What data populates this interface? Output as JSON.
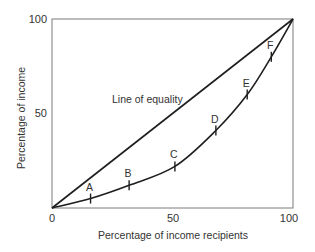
{
  "chart_data": {
    "type": "line",
    "title": "",
    "xlabel": "Percentage of income recipients",
    "ylabel": "Percentage of income",
    "xlim": [
      0,
      100
    ],
    "ylim": [
      0,
      100
    ],
    "x_ticks": [
      "0",
      "50",
      "100"
    ],
    "y_ticks": [
      "50",
      "100"
    ],
    "grid": false,
    "legend": null,
    "annotations": [
      {
        "text": "Line of equality",
        "x": 25,
        "y": 57
      }
    ],
    "series": [
      {
        "name": "Line of equality",
        "x": [
          0,
          100
        ],
        "y": [
          0,
          100
        ]
      },
      {
        "name": "Lorenz curve",
        "x": [
          0,
          16,
          32,
          51,
          68,
          81,
          91,
          100
        ],
        "y": [
          0,
          5,
          12,
          22,
          41,
          60,
          80,
          100
        ]
      }
    ],
    "points": [
      {
        "label": "A",
        "x": 16,
        "y": 5
      },
      {
        "label": "B",
        "x": 32,
        "y": 12
      },
      {
        "label": "C",
        "x": 51,
        "y": 22
      },
      {
        "label": "D",
        "x": 68,
        "y": 41
      },
      {
        "label": "E",
        "x": 81,
        "y": 60
      },
      {
        "label": "F",
        "x": 91,
        "y": 80
      }
    ]
  },
  "colors": {
    "frame": "#7a7a7a",
    "line": "#1e1e1e",
    "text": "#333333"
  }
}
